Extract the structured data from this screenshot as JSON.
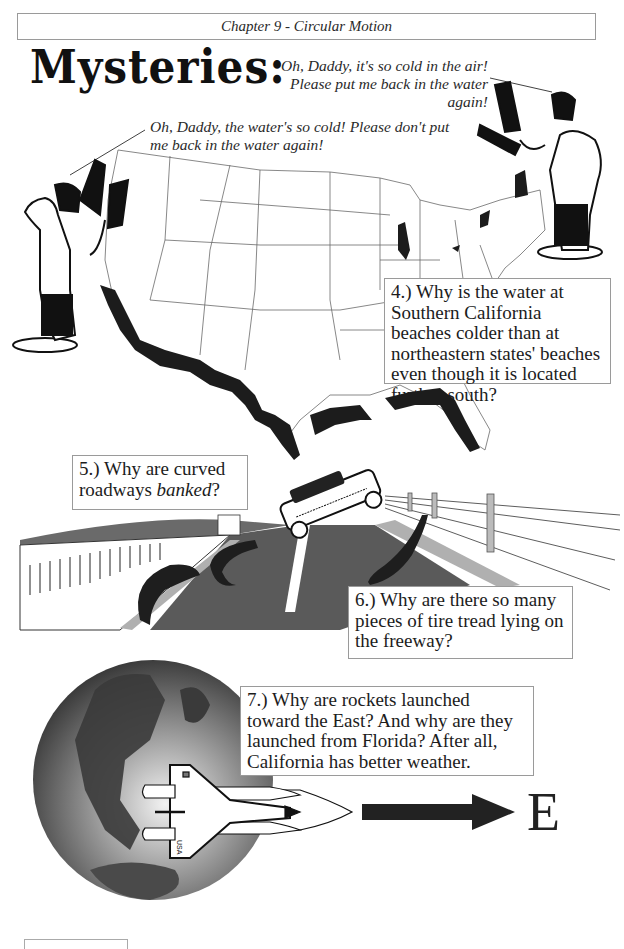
{
  "header": {
    "chapter_title": "Chapter 9 - Circular Motion"
  },
  "page_title": "Mysteries:",
  "speech_bubbles": {
    "right_child": "Oh, Daddy,  it's so cold in the air! Please put me back in the water again!",
    "left_child": "Oh, Daddy, the water's so cold!  Please don't put me back in the water again!"
  },
  "questions": [
    {
      "number": "4.)",
      "text": "Why is the water at Southern California beaches colder than at northeastern states' beaches even though it is located further south?"
    },
    {
      "number": "5.)",
      "text_before": "Why are curved roadways ",
      "emphasis": "banked",
      "text_after": "?"
    },
    {
      "number": "6.)",
      "text": "Why are there so many pieces of tire tread lying on the freeway?"
    },
    {
      "number": "7.)",
      "text": "Why are rockets launched toward the East? And why are they launched from Florida?  After all, California has better weather."
    }
  ],
  "direction_label": "E",
  "illustrations": {
    "map": "us-map-coastlines-icon",
    "parents": "father-holding-child-icon",
    "road": "banked-highway-car-icon",
    "tire_treads": "tire-tread-icon",
    "globe": "earth-globe-icon",
    "shuttle": "space-shuttle-icon",
    "shuttle_label": "USA",
    "arrow": "east-arrow-icon"
  },
  "colors": {
    "ink": "#1c1c1c",
    "box_border": "#9a9a9a",
    "road_gray": "#5a5a5a",
    "globe_dark": "#3a3a3a"
  }
}
